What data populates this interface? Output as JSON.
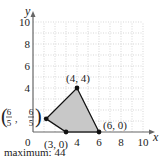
{
  "chart_data": {
    "type": "scatter",
    "title": "",
    "xlabel": "x",
    "ylabel": "y",
    "xlim": [
      0,
      10
    ],
    "ylim": [
      0,
      10
    ],
    "grid": true,
    "x_ticks": [
      0,
      4,
      6,
      8,
      10
    ],
    "y_ticks": [
      4,
      6,
      8,
      10
    ],
    "x_tick_labels": [
      "0",
      "4",
      "6",
      "8",
      "10"
    ],
    "y_tick_labels": [
      "4",
      "6",
      "8",
      "10"
    ],
    "feasible_region": {
      "fill": "#c8c8c8",
      "vertices": [
        {
          "x": 1.2,
          "y": 1.2,
          "label": "(6/5, 6/5)"
        },
        {
          "x": 4,
          "y": 4,
          "label": "(4, 4)"
        },
        {
          "x": 6,
          "y": 0,
          "label": "(6, 0)"
        },
        {
          "x": 3,
          "y": 0,
          "label": "(3, 0)"
        }
      ]
    },
    "annotations": [
      {
        "text": "(4, 4)",
        "x": 4,
        "y": 4
      },
      {
        "text": "(6, 0)",
        "x": 6,
        "y": 0
      },
      {
        "text": "(3, 0)",
        "x": 3,
        "y": 0
      },
      {
        "text": "(6/5, 6/5)",
        "x": 1.2,
        "y": 1.2
      }
    ]
  },
  "labels": {
    "x_axis": "x",
    "y_axis": "y",
    "origin": "0",
    "caption": "maximum: 44",
    "pt_44": "(4, 4)",
    "pt_60": "(6, 0)",
    "pt_30": "(3, 0)",
    "frac_num": "6",
    "frac_den": "5"
  }
}
